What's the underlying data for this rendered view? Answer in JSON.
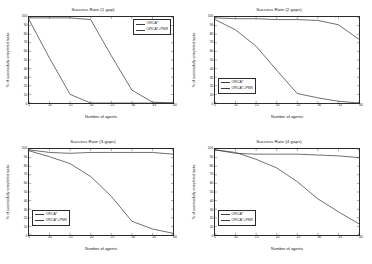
{
  "figure": {
    "background": "#ffffff",
    "line_color": "#3c3c3c",
    "axis_color": "#2b2b2b",
    "series_names": [
      "ORCA*",
      "ORCA*+PNR"
    ]
  },
  "axes": {
    "xlabel": "Number of agents",
    "ylabel": "% of successfully completed tasks",
    "xticks": [
      "5",
      "10",
      "15",
      "20",
      "25",
      "30",
      "35",
      "40"
    ],
    "yticks": [
      "0",
      "10",
      "20",
      "30",
      "40",
      "50",
      "60",
      "70",
      "80",
      "90",
      "100"
    ],
    "xlim": [
      5,
      40
    ],
    "ylim": [
      0,
      100
    ]
  },
  "panels": [
    {
      "id": "panel-1-gap",
      "title": "Success Rate (1 gap)",
      "legend_position": "top-right",
      "legend": [
        "ORCA*",
        "ORCA*+PNR"
      ]
    },
    {
      "id": "panel-2-gaps",
      "title": "Success Rate (2 gaps)",
      "legend_position": "bottom-left",
      "legend": [
        "ORCA*",
        "ORCA*+PNR"
      ]
    },
    {
      "id": "panel-3-gaps",
      "title": "Success Rate (3 gaps)",
      "legend_position": "bottom-left",
      "legend": [
        "ORCA*",
        "ORCA*+PNR"
      ]
    },
    {
      "id": "panel-4-gaps",
      "title": "Success Rate (4 gaps)",
      "legend_position": "bottom-left",
      "legend": [
        "ORCA*",
        "ORCA*+PNR"
      ]
    }
  ],
  "chart_data": [
    {
      "type": "line",
      "title": "Success Rate (1 gap)",
      "xlabel": "Number of agents",
      "ylabel": "% of successfully completed tasks",
      "xlim": [
        5,
        40
      ],
      "ylim": [
        0,
        100
      ],
      "grid": false,
      "legend_position": "top-right",
      "x": [
        5,
        10,
        15,
        20,
        25,
        30,
        35,
        40
      ],
      "series": [
        {
          "name": "ORCA*",
          "values": [
            97,
            52,
            10,
            0,
            0,
            0,
            0,
            0
          ]
        },
        {
          "name": "ORCA*+PNR",
          "values": [
            99,
            99,
            99,
            97,
            55,
            15,
            1,
            0
          ]
        }
      ]
    },
    {
      "type": "line",
      "title": "Success Rate (2 gaps)",
      "xlabel": "Number of agents",
      "ylabel": "% of successfully completed tasks",
      "xlim": [
        5,
        40
      ],
      "ylim": [
        0,
        100
      ],
      "grid": false,
      "legend_position": "bottom-left",
      "x": [
        5,
        10,
        15,
        20,
        25,
        30,
        35,
        40
      ],
      "series": [
        {
          "name": "ORCA*",
          "values": [
            97,
            85,
            66,
            38,
            11,
            6,
            2,
            0
          ]
        },
        {
          "name": "ORCA*+PNR",
          "values": [
            99,
            98,
            98,
            97,
            97,
            96,
            91,
            74
          ]
        }
      ]
    },
    {
      "type": "line",
      "title": "Success Rate (3 gaps)",
      "xlabel": "Number of agents",
      "ylabel": "% of successfully completed tasks",
      "xlim": [
        5,
        40
      ],
      "ylim": [
        0,
        100
      ],
      "grid": false,
      "legend_position": "bottom-left",
      "x": [
        5,
        10,
        15,
        20,
        25,
        30,
        35,
        40
      ],
      "series": [
        {
          "name": "ORCA*",
          "values": [
            98,
            91,
            83,
            68,
            45,
            16,
            7,
            2
          ]
        },
        {
          "name": "ORCA*+PNR",
          "values": [
            99,
            96,
            95,
            96,
            96,
            96,
            96,
            94
          ]
        }
      ]
    },
    {
      "type": "line",
      "title": "Success Rate (4 gaps)",
      "xlabel": "Number of agents",
      "ylabel": "% of successfully completed tasks",
      "xlim": [
        5,
        40
      ],
      "ylim": [
        0,
        100
      ],
      "grid": false,
      "legend_position": "bottom-left",
      "x": [
        5,
        10,
        15,
        20,
        25,
        30,
        35,
        40
      ],
      "series": [
        {
          "name": "ORCA*",
          "values": [
            99,
            96,
            88,
            78,
            62,
            42,
            27,
            13
          ]
        },
        {
          "name": "ORCA*+PNR",
          "values": [
            99,
            95,
            94,
            94,
            94,
            93,
            92,
            90
          ]
        }
      ]
    }
  ]
}
